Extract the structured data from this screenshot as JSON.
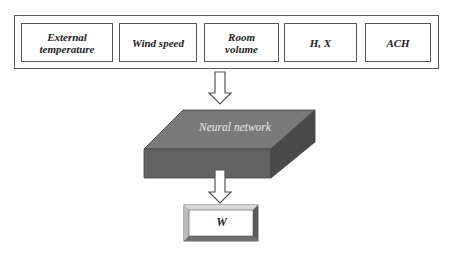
{
  "inputs": {
    "items": [
      {
        "label": "External temperature",
        "line1": "External",
        "line2": "temperature"
      },
      {
        "label": "Wind speed",
        "line1": "Wind speed",
        "line2": ""
      },
      {
        "label": "Room volume",
        "line1": "Room",
        "line2": "volume"
      },
      {
        "label": "H, X",
        "line1": "H, X",
        "line2": ""
      },
      {
        "label": "ACH",
        "line1": "ACH",
        "line2": ""
      }
    ]
  },
  "model": {
    "label": "Neural network"
  },
  "output": {
    "label": "W"
  },
  "colors": {
    "slab_top": "#7a7a7a",
    "slab_front": "#636363",
    "slab_side": "#4a4a4a",
    "stroke": "#555555"
  }
}
